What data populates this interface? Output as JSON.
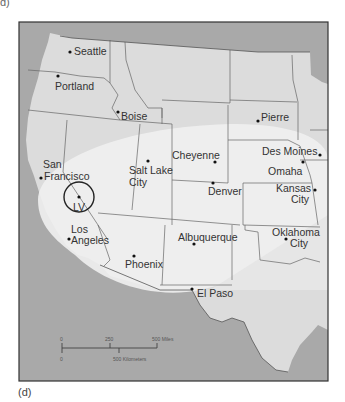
{
  "figure": {
    "label_top": "d)",
    "label_bottom": "(d)"
  },
  "map": {
    "title": "Western United States",
    "colors": {
      "water_ocean": "#a9a9a9",
      "land_us": "#dcdcdc",
      "land_outside": "#a5a5a5",
      "highlight_region": "#efefef",
      "state_border": "#666666",
      "frame": "#333333",
      "city_dot": "#111111",
      "text": "#333333"
    },
    "cities": [
      {
        "name": "Seattle",
        "lines": [
          "Seattle"
        ]
      },
      {
        "name": "Portland",
        "lines": [
          "Portland"
        ]
      },
      {
        "name": "Boise",
        "lines": [
          "Boise"
        ]
      },
      {
        "name": "Pierre",
        "lines": [
          "Pierre"
        ]
      },
      {
        "name": "San Francisco",
        "lines": [
          "San",
          "Francisco"
        ]
      },
      {
        "name": "Salt Lake City",
        "lines": [
          "Salt Lake",
          "City"
        ]
      },
      {
        "name": "Cheyenne",
        "lines": [
          "Cheyenne"
        ]
      },
      {
        "name": "Des Moines",
        "lines": [
          "Des Moines"
        ]
      },
      {
        "name": "Omaha",
        "lines": [
          "Omaha"
        ]
      },
      {
        "name": "Denver",
        "lines": [
          "Denver"
        ]
      },
      {
        "name": "Kansas City",
        "lines": [
          "Kansas",
          "City"
        ]
      },
      {
        "name": "Las Vegas",
        "lines": [
          "LV"
        ]
      },
      {
        "name": "Los Angeles",
        "lines": [
          "Los",
          "Angeles"
        ]
      },
      {
        "name": "Albuquerque",
        "lines": [
          "Albuquerque"
        ]
      },
      {
        "name": "Oklahoma City",
        "lines": [
          "Oklahoma",
          "City"
        ]
      },
      {
        "name": "Phoenix",
        "lines": [
          "Phoenix"
        ]
      },
      {
        "name": "El Paso",
        "lines": [
          "El Paso"
        ]
      }
    ],
    "scale_bar": {
      "miles_ticks": [
        "0",
        "250",
        "500 Miles"
      ],
      "km_ticks": [
        "0",
        "500 Kilometers"
      ]
    }
  }
}
